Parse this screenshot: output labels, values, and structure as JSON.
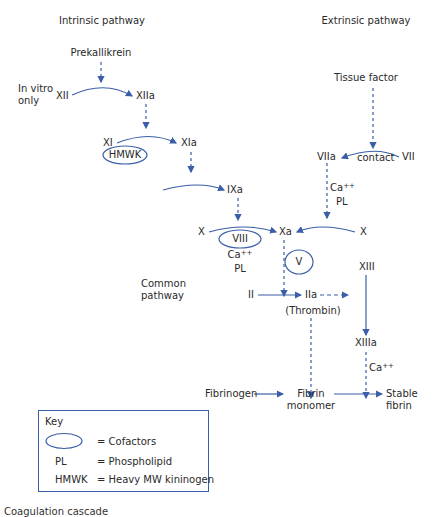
{
  "headers": {
    "intrinsic": "Intrinsic pathway",
    "extrinsic": "Extrinsic pathway",
    "common": [
      "Common",
      "pathway"
    ]
  },
  "nodes": {
    "prekallikrein": "Prekallikrein",
    "in_vitro": [
      "In vitro",
      "only"
    ],
    "xii": "XII",
    "xiia": "XIIa",
    "xi": "XI",
    "xia": "XIa",
    "hmwk": "HMWK",
    "ixa": "IXa",
    "x_left": "X",
    "viii": "VIII",
    "ca_left": "Ca",
    "pl_left": "PL",
    "xa": "Xa",
    "v": "V",
    "tissue_factor": "Tissue factor",
    "viia": "VIIa",
    "contact": "contact",
    "vii": "VII",
    "ca_right": "Ca",
    "pl_right": "PL",
    "x_right": "X",
    "xiii": "XIII",
    "ii": "II",
    "iia": "IIa",
    "thrombin": "(Thrombin)",
    "xiiia": "XIIIa",
    "ca_xiiia": "Ca",
    "fibrinogen": "Fibrinogen",
    "fibrin_monomer": [
      "Fibrin",
      "monomer"
    ],
    "stable_fibrin": [
      "Stable",
      "fibrin"
    ],
    "ca_sup": "++"
  },
  "key": {
    "title": "Key",
    "items": [
      {
        "symbol": "",
        "desc": "= Cofactors"
      },
      {
        "symbol": "PL",
        "desc": "= Phospholipid"
      },
      {
        "symbol": "HMWK",
        "desc": "= Heavy MW kininogen"
      }
    ]
  },
  "caption": "Coagulation cascade",
  "colors": {
    "arrow": "#3a5fa8",
    "text": "#2a2a2a"
  }
}
